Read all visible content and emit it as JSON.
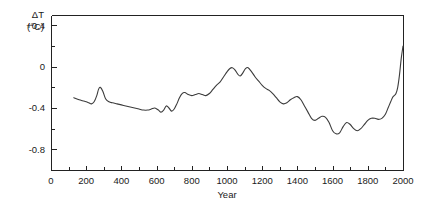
{
  "chart_data": {
    "type": "line",
    "title": "",
    "subtitle": "",
    "xlabel": "Year",
    "ylabel": "ΔT (°C)",
    "ylabel_lines": [
      "ΔT",
      "(°C)"
    ],
    "xlim": [
      0,
      2000
    ],
    "ylim": [
      -1.0,
      0.5
    ],
    "grid": false,
    "legend": null,
    "xticks": [
      0,
      200,
      400,
      600,
      800,
      1000,
      1200,
      1400,
      1600,
      1800,
      2000
    ],
    "xticklabels": [
      "0",
      "200",
      "400",
      "600",
      "800",
      "1000",
      "1200",
      "1400",
      "1600",
      "1800",
      "2000"
    ],
    "xminor_step": 100,
    "yticks": [
      0.4,
      0.0,
      -0.4,
      -0.8
    ],
    "yticklabels": [
      "+0.4",
      "0",
      "-0.4",
      "-0.8"
    ],
    "yminor_step": 0.2,
    "series": [
      {
        "name": "Northern Hemisphere temperature anomaly",
        "x": [
          130,
          160,
          180,
          200,
          215,
          230,
          245,
          260,
          270,
          280,
          295,
          310,
          330,
          350,
          375,
          400,
          425,
          450,
          475,
          500,
          525,
          550,
          570,
          590,
          610,
          625,
          640,
          655,
          670,
          685,
          700,
          715,
          730,
          745,
          760,
          780,
          800,
          820,
          840,
          860,
          880,
          900,
          920,
          940,
          960,
          980,
          1000,
          1015,
          1030,
          1045,
          1060,
          1075,
          1090,
          1105,
          1120,
          1140,
          1160,
          1180,
          1200,
          1220,
          1240,
          1260,
          1280,
          1300,
          1320,
          1340,
          1360,
          1380,
          1400,
          1420,
          1440,
          1460,
          1480,
          1500,
          1520,
          1540,
          1560,
          1580,
          1600,
          1620,
          1640,
          1660,
          1680,
          1700,
          1720,
          1740,
          1760,
          1780,
          1800,
          1820,
          1840,
          1860,
          1880,
          1900,
          1915,
          1930,
          1940,
          1950,
          1960,
          1970,
          1980,
          1990,
          2000
        ],
        "y": [
          -0.3,
          -0.32,
          -0.33,
          -0.34,
          -0.35,
          -0.36,
          -0.34,
          -0.28,
          -0.22,
          -0.2,
          -0.24,
          -0.31,
          -0.34,
          -0.35,
          -0.36,
          -0.37,
          -0.38,
          -0.39,
          -0.4,
          -0.41,
          -0.42,
          -0.42,
          -0.41,
          -0.4,
          -0.42,
          -0.44,
          -0.42,
          -0.38,
          -0.4,
          -0.43,
          -0.41,
          -0.36,
          -0.3,
          -0.26,
          -0.25,
          -0.27,
          -0.28,
          -0.27,
          -0.26,
          -0.27,
          -0.28,
          -0.26,
          -0.22,
          -0.18,
          -0.15,
          -0.1,
          -0.05,
          -0.02,
          -0.01,
          -0.03,
          -0.07,
          -0.09,
          -0.06,
          -0.02,
          -0.01,
          -0.05,
          -0.1,
          -0.14,
          -0.18,
          -0.21,
          -0.23,
          -0.26,
          -0.3,
          -0.34,
          -0.36,
          -0.35,
          -0.32,
          -0.3,
          -0.29,
          -0.32,
          -0.38,
          -0.44,
          -0.5,
          -0.52,
          -0.5,
          -0.48,
          -0.49,
          -0.54,
          -0.62,
          -0.65,
          -0.64,
          -0.58,
          -0.54,
          -0.56,
          -0.6,
          -0.62,
          -0.6,
          -0.56,
          -0.52,
          -0.5,
          -0.5,
          -0.51,
          -0.5,
          -0.46,
          -0.4,
          -0.34,
          -0.3,
          -0.28,
          -0.26,
          -0.2,
          -0.08,
          0.08,
          0.2
        ],
        "style": "solid",
        "color": "#3c3c3c"
      }
    ],
    "annotations": [],
    "notable_features": {
      "medieval_warm_peak_year": 1010,
      "medieval_warm_peak_value": -0.01,
      "little_ice_age_min_year": 1620,
      "little_ice_age_min_value": -0.65,
      "modern_end_year": 2000,
      "modern_end_value": 0.2,
      "series_start_year": 130,
      "series_start_value": -0.3
    },
    "geometry": {
      "plot_left_px": 51,
      "plot_right_px": 403,
      "plot_top_px": 15,
      "plot_bottom_px": 170,
      "y_value_at_top_px": 0.5,
      "y_value_at_bottom_px": -1.0
    }
  }
}
